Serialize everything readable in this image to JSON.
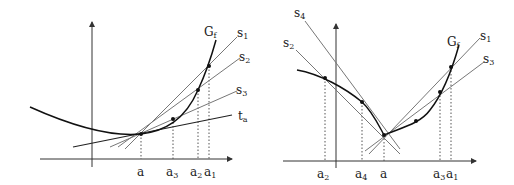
{
  "left_diagram": {
    "curve_label": "G",
    "curve_label_sub": "f",
    "lines": [
      {
        "name": "s",
        "sub": "1"
      },
      {
        "name": "s",
        "sub": "2"
      },
      {
        "name": "s",
        "sub": "3"
      },
      {
        "name": "t",
        "sub": "a"
      }
    ],
    "x_labels": [
      {
        "name": "a",
        "sub": ""
      },
      {
        "name": "a",
        "sub": "3"
      },
      {
        "name": "a",
        "sub": "2"
      },
      {
        "name": "a",
        "sub": "1"
      }
    ]
  },
  "right_diagram": {
    "curve_label": "G",
    "curve_label_sub": "f",
    "lines": [
      {
        "name": "s",
        "sub": "4"
      },
      {
        "name": "s",
        "sub": "2"
      },
      {
        "name": "s",
        "sub": "1"
      },
      {
        "name": "s",
        "sub": "3"
      }
    ],
    "x_labels": [
      {
        "name": "a",
        "sub": "2"
      },
      {
        "name": "a",
        "sub": "4"
      },
      {
        "name": "a",
        "sub": ""
      },
      {
        "name": "a",
        "sub": "3"
      },
      {
        "name": "a",
        "sub": "1"
      }
    ]
  },
  "colors": {
    "curve": "#111111",
    "secant": "#777777",
    "axis": "#333333",
    "guide": "#555555"
  }
}
